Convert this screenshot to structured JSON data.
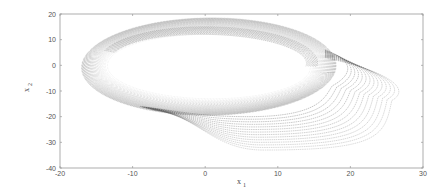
{
  "chart_data": {
    "type": "scatter",
    "title": "",
    "xlabel": "x",
    "xlabel_subscript": "1",
    "ylabel": "x",
    "ylabel_subscript": "2",
    "xlim": [
      -20,
      30
    ],
    "ylim": [
      -40,
      20
    ],
    "xticks": [
      -20,
      -10,
      0,
      10,
      20,
      30
    ],
    "yticks": [
      20,
      10,
      0,
      -10,
      -20,
      -30,
      -40
    ],
    "grid": false,
    "legend": null,
    "attractor": {
      "outer_band": {
        "cx": 0.5,
        "cy": -0.5,
        "rx_outer": 17.5,
        "ry_outer": 19.0,
        "rx_inner": 14.0,
        "ry_inner": 12.5,
        "tilt_deg": -8
      },
      "spiral_lobe": {
        "count": 14,
        "start_point": [
          16.5,
          6.0
        ],
        "rightmost": [
          25.7,
          -13.7
        ],
        "bottom": [
          6.0,
          -33.0
        ],
        "end_point": [
          -9.0,
          -16.0
        ]
      },
      "key_points": [
        {
          "label": "leftmost",
          "x": -17.0,
          "y": 0.0
        },
        {
          "label": "top",
          "x": 2.0,
          "y": 18.5
        },
        {
          "label": "inner-right",
          "x": 17.0,
          "y": -3.0
        },
        {
          "label": "lobe-rightmost",
          "x": 25.7,
          "y": -13.7
        },
        {
          "label": "lobe-bottom",
          "x": 6.0,
          "y": -33.0
        }
      ]
    }
  },
  "colors": {
    "frame": "#9a9a9a",
    "trajectory": "#3a3a3a",
    "text": "#555555"
  }
}
